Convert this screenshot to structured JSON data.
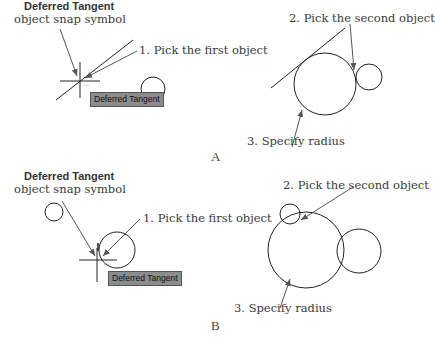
{
  "panel_a": {
    "letter": "A",
    "snap_symbol_title": "Deferred Tangent",
    "snap_symbol_subtitle": "object snap symbol",
    "step1": "1. Pick the first object",
    "step2": "2. Pick the second object",
    "step3": "3. Specify radius",
    "tooltip": "Deferred Tangent"
  },
  "panel_b": {
    "letter": "B",
    "snap_symbol_title": "Deferred Tangent",
    "snap_symbol_subtitle": "object snap symbol",
    "step1": "1. Pick the first object",
    "step2": "2. Pick the second object",
    "step3": "3. Specify radius",
    "tooltip": "Deferred Tangent"
  },
  "colors": {
    "line": "#222222",
    "arrow": "#555555",
    "tooltip_bg": "#8c8c8c"
  }
}
